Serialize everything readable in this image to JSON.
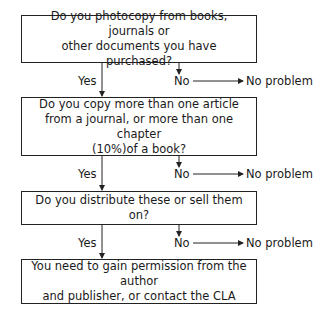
{
  "flowchart": {
    "steps": [
      {
        "question": "Do you photocopy from books, journals or other documents you have purchased?",
        "line1": "Do you photocopy from books, journals or",
        "line2": "other documents you have purchased?",
        "yes_label": "Yes",
        "no_label": "No",
        "no_outcome": "No problem"
      },
      {
        "question": "Do you copy more than one article from a journal, or more than one chapter (10%)of a book?",
        "line1": "Do you copy more than one article",
        "line2": "from a journal, or more than one chapter",
        "line3": "(10%)of a book?",
        "yes_label": "Yes",
        "no_label": "No",
        "no_outcome": "No problem"
      },
      {
        "question": "Do you distribute these or sell them on?",
        "line1": "Do you distribute these or sell them on?",
        "yes_label": "Yes",
        "no_label": "No",
        "no_outcome": "No problem"
      }
    ],
    "final": {
      "line1": "You need to gain permission from the author",
      "line2": "and publisher, or contact the CLA"
    }
  }
}
